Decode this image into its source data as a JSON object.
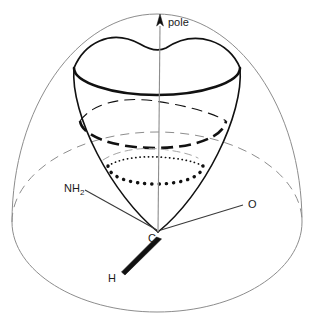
{
  "figure": {
    "labels": {
      "pole": "pole",
      "amine": "NH",
      "amine_subscript": "2",
      "carbon": "C",
      "oxygen": "O",
      "hydrogen": "H"
    },
    "colors": {
      "stroke_dark": "#111111",
      "stroke_light": "#8d8d8d",
      "stroke_mid": "#555555",
      "background": "#ffffff"
    },
    "geometry": {
      "sphere_center_x": 157,
      "sphere_center_y": 222,
      "sphere_rx": 145,
      "sphere_ry": 90,
      "dome_top_y": 14,
      "apex_x": 158,
      "apex_y": 232,
      "cone_rim_top_y": 68,
      "cone_rim_rx": 83,
      "cone_rim_ry": 24
    },
    "elements": [
      {
        "name": "outer-sphere-dome",
        "style": "thin-solid"
      },
      {
        "name": "equator-ellipse-back",
        "style": "thin-dashed"
      },
      {
        "name": "equator-ellipse-front",
        "style": "thin-solid"
      },
      {
        "name": "cone-rim-top",
        "style": "thick-solid"
      },
      {
        "name": "cone-ring-middle",
        "style": "thick-dashed"
      },
      {
        "name": "cone-ring-lower",
        "style": "thick-dotted"
      },
      {
        "name": "cone-ring-faint",
        "style": "thin-dashed"
      },
      {
        "name": "polar-axis",
        "style": "thin-solid-arrow"
      },
      {
        "name": "bond-c-nh2",
        "style": "plain"
      },
      {
        "name": "bond-c-o",
        "style": "plain"
      },
      {
        "name": "bond-c-h",
        "style": "bold-wedge"
      }
    ]
  }
}
